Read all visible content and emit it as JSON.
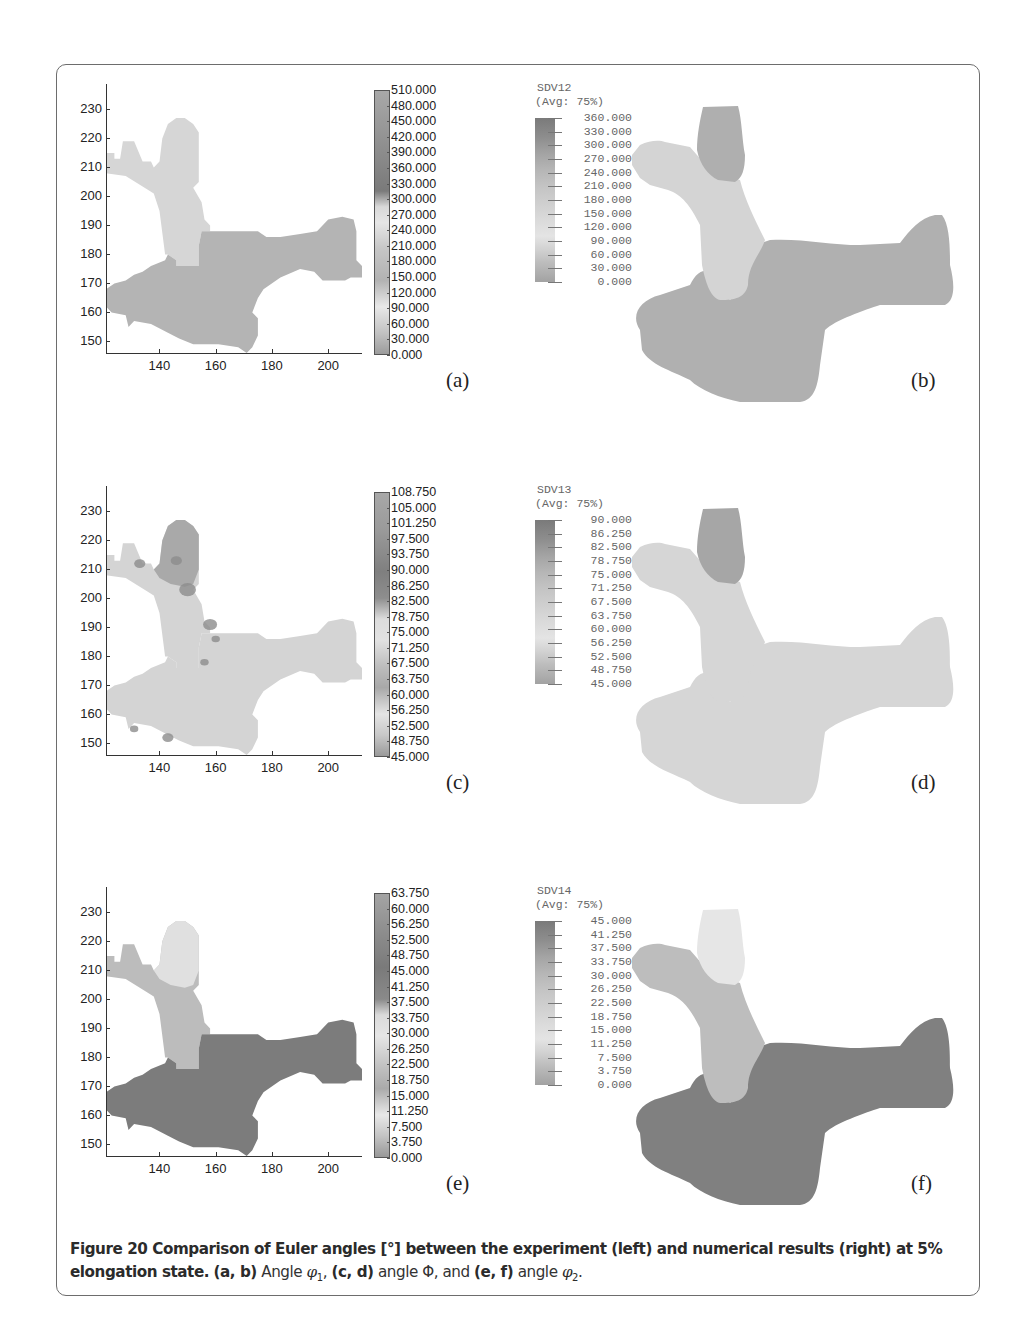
{
  "figure": {
    "number": "Figure 20",
    "caption_bold": "Figure 20 Comparison of Euler angles [°] between the experiment (left) and numerical results (right) at 5% elongation state.",
    "caption_parts": [
      {
        "text": "(a, b)",
        "bold": true
      },
      {
        "text": " Angle ",
        "bold": false
      },
      {
        "text": "φ",
        "italic": true,
        "sub": "1"
      },
      {
        "text": ", ",
        "bold": false
      },
      {
        "text": "(c, d)",
        "bold": true
      },
      {
        "text": " angle Φ, and ",
        "bold": false
      },
      {
        "text": "(e, f)",
        "bold": true
      },
      {
        "text": " angle ",
        "bold": false
      },
      {
        "text": "φ",
        "italic": true,
        "sub": "2"
      },
      {
        "text": ".",
        "bold": false
      }
    ]
  },
  "labels": {
    "a": "(a)",
    "b": "(b)",
    "c": "(c)",
    "d": "(d)",
    "e": "(e)",
    "f": "(f)"
  },
  "axes": {
    "yticks": [
      "230",
      "220",
      "210",
      "200",
      "190",
      "180",
      "170",
      "160",
      "150"
    ],
    "xticks": [
      "140",
      "160",
      "180",
      "200"
    ]
  },
  "colorbars_left": {
    "a": [
      "510.000",
      "480.000",
      "450.000",
      "420.000",
      "390.000",
      "360.000",
      "330.000",
      "300.000",
      "270.000",
      "240.000",
      "210.000",
      "180.000",
      "150.000",
      "120.000",
      "90.000",
      "60.000",
      "30.000",
      "0.000"
    ],
    "c": [
      "108.750",
      "105.000",
      "101.250",
      "97.500",
      "93.750",
      "90.000",
      "86.250",
      "82.500",
      "78.750",
      "75.000",
      "71.250",
      "67.500",
      "63.750",
      "60.000",
      "56.250",
      "52.500",
      "48.750",
      "45.000"
    ],
    "e": [
      "63.750",
      "60.000",
      "56.250",
      "52.500",
      "48.750",
      "45.000",
      "41.250",
      "37.500",
      "33.750",
      "30.000",
      "26.250",
      "22.500",
      "18.750",
      "15.000",
      "11.250",
      "7.500",
      "3.750",
      "0.000"
    ]
  },
  "colorbars_right": {
    "b": {
      "title": "SDV12",
      "avg": "(Avg: 75%)",
      "values": [
        "360.000",
        "330.000",
        "300.000",
        "270.000",
        "240.000",
        "210.000",
        "180.000",
        "150.000",
        "120.000",
        "90.000",
        "60.000",
        "30.000",
        "0.000"
      ]
    },
    "d": {
      "title": "SDV13",
      "avg": "(Avg: 75%)",
      "values": [
        "90.000",
        "86.250",
        "82.500",
        "78.750",
        "75.000",
        "71.250",
        "67.500",
        "63.750",
        "60.000",
        "56.250",
        "52.500",
        "48.750",
        "45.000"
      ]
    },
    "f": {
      "title": "SDV14",
      "avg": "(Avg: 75%)",
      "values": [
        "45.000",
        "41.250",
        "37.500",
        "33.750",
        "30.000",
        "26.250",
        "22.500",
        "18.750",
        "15.000",
        "11.250",
        "7.500",
        "3.750",
        "0.000"
      ]
    }
  },
  "chart_data": [
    {
      "type": "heatmap",
      "panel": "(a)",
      "title": "Experiment – Angle φ1",
      "xlabel": "",
      "ylabel": "",
      "xlim": [
        121,
        212
      ],
      "ylim": [
        146,
        236
      ],
      "xticks": [
        140,
        160,
        180,
        200
      ],
      "yticks": [
        150,
        160,
        170,
        180,
        190,
        200,
        210,
        220,
        230
      ],
      "colorbar": {
        "min": 0,
        "max": 510,
        "step": 30
      },
      "regions": [
        {
          "name": "upper-left grain",
          "approx_value": 90,
          "shade": "light"
        },
        {
          "name": "lower/right grain",
          "approx_value": 160,
          "shade": "medium"
        }
      ]
    },
    {
      "type": "heatmap",
      "panel": "(b)",
      "title": "Simulation SDV12 (Avg: 75%)",
      "colorbar": {
        "min": 0,
        "max": 360,
        "step": 30
      },
      "regions": [
        {
          "name": "top grain",
          "approx_value": 210
        },
        {
          "name": "upper-left arm",
          "approx_value": 100
        },
        {
          "name": "lower body",
          "approx_value": 170
        }
      ]
    },
    {
      "type": "heatmap",
      "panel": "(c)",
      "title": "Experiment – Angle Φ",
      "xlim": [
        121,
        212
      ],
      "ylim": [
        146,
        236
      ],
      "xticks": [
        140,
        160,
        180,
        200
      ],
      "yticks": [
        150,
        160,
        170,
        180,
        190,
        200,
        210,
        220,
        230
      ],
      "colorbar": {
        "min": 45,
        "max": 108.75,
        "step": 3.75
      },
      "regions": [
        {
          "name": "top grain",
          "approx_value": 70
        },
        {
          "name": "body",
          "approx_value": 58
        }
      ]
    },
    {
      "type": "heatmap",
      "panel": "(d)",
      "title": "Simulation SDV13 (Avg: 75%)",
      "colorbar": {
        "min": 45,
        "max": 90,
        "step": 3.75
      },
      "regions": [
        {
          "name": "top grain",
          "approx_value": 70
        },
        {
          "name": "body",
          "approx_value": 58
        }
      ]
    },
    {
      "type": "heatmap",
      "panel": "(e)",
      "title": "Experiment – Angle φ2",
      "xlim": [
        121,
        212
      ],
      "ylim": [
        146,
        236
      ],
      "xticks": [
        140,
        160,
        180,
        200
      ],
      "yticks": [
        150,
        160,
        170,
        180,
        190,
        200,
        210,
        220,
        230
      ],
      "colorbar": {
        "min": 0,
        "max": 63.75,
        "step": 3.75
      },
      "regions": [
        {
          "name": "top grain",
          "approx_value": 10
        },
        {
          "name": "upper-left arm",
          "approx_value": 22
        },
        {
          "name": "lower body",
          "approx_value": 42
        }
      ]
    },
    {
      "type": "heatmap",
      "panel": "(f)",
      "title": "Simulation SDV14 (Avg: 75%)",
      "colorbar": {
        "min": 0,
        "max": 45,
        "step": 3.75
      },
      "regions": [
        {
          "name": "top grain",
          "approx_value": 10
        },
        {
          "name": "upper-left arm",
          "approx_value": 22
        },
        {
          "name": "lower body",
          "approx_value": 42
        }
      ]
    }
  ],
  "colors": {
    "frame_border": "#6d6d6d",
    "a_light": "#d6d6d6",
    "a_dark": "#b4b4b4",
    "b_top": "#afafaf",
    "b_arm": "#d4d4d4",
    "b_body": "#b0b0b0",
    "c_top": "#a9a9a9",
    "c_body": "#d4d4d4",
    "c_spots": "#8c8c8c",
    "d_top": "#a6a6a6",
    "d_body": "#d6d6d6",
    "e_top": "#e0e0e0",
    "e_arm": "#bcbcbc",
    "e_body": "#7c7c7c",
    "f_top": "#e6e6e6",
    "f_arm": "#bdbdbd",
    "f_body": "#808080"
  }
}
